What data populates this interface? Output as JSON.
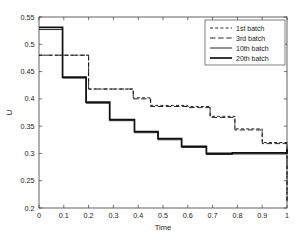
{
  "figure": {
    "background": "#ffffff",
    "axis_color": "#3b3b3b",
    "line_color": "#111111"
  },
  "axis": {
    "xlabel": "Time",
    "ylabel": "U",
    "x_ticks": [
      "0",
      "0.1",
      "0.2",
      "0.3",
      "0.4",
      "0.5",
      "0.6",
      "0.7",
      "0.8",
      "0.9",
      "1"
    ],
    "y_ticks": [
      "0.2",
      "0.25",
      "0.3",
      "0.35",
      "0.4",
      "0.45",
      "0.5",
      "0.55"
    ]
  },
  "legend": {
    "position": "top-right",
    "entries": [
      {
        "label": "1st batch",
        "style": "dashed-short",
        "width": 0.9
      },
      {
        "label": "3rd batch",
        "style": "dashed-long",
        "width": 0.9
      },
      {
        "label": "10th batch",
        "style": "solid",
        "width": 0.9
      },
      {
        "label": "20th batch",
        "style": "solid",
        "width": 1.7
      }
    ]
  },
  "chart_data": {
    "type": "line",
    "title": "",
    "xlabel": "Time",
    "ylabel": "U",
    "xlim": [
      0,
      1
    ],
    "ylim": [
      0.2,
      0.55
    ],
    "x_ticks": [
      0,
      0.1,
      0.2,
      0.3,
      0.4,
      0.5,
      0.6,
      0.7,
      0.8,
      0.9,
      1
    ],
    "y_ticks": [
      0.2,
      0.25,
      0.3,
      0.35,
      0.4,
      0.45,
      0.5,
      0.55
    ],
    "grid": false,
    "legend_position": "upper right",
    "step_style": "post",
    "series": [
      {
        "name": "1st batch",
        "style": "dashed-short",
        "linewidth": 0.9,
        "x": [
          0,
          0.1,
          0.2,
          0.29,
          0.38,
          0.45,
          0.5,
          0.6,
          0.69,
          0.79,
          0.9,
          1.0
        ],
        "values": [
          0.48,
          0.48,
          0.418,
          0.418,
          0.402,
          0.388,
          0.388,
          0.386,
          0.368,
          0.345,
          0.32,
          0.212
        ]
      },
      {
        "name": "3rd batch",
        "style": "dashed-long",
        "linewidth": 0.9,
        "x": [
          0,
          0.1,
          0.2,
          0.29,
          0.38,
          0.45,
          0.5,
          0.6,
          0.69,
          0.79,
          0.9,
          1.0
        ],
        "values": [
          0.48,
          0.48,
          0.418,
          0.418,
          0.4,
          0.386,
          0.386,
          0.384,
          0.366,
          0.343,
          0.318,
          0.212
        ]
      },
      {
        "name": "10th batch",
        "style": "solid",
        "linewidth": 0.9,
        "x": [
          0,
          0.095,
          0.19,
          0.285,
          0.385,
          0.48,
          0.575,
          0.675,
          0.78,
          0.89,
          1.0
        ],
        "values": [
          0.527,
          0.438,
          0.392,
          0.36,
          0.338,
          0.325,
          0.311,
          0.298,
          0.299,
          0.299,
          0.307
        ]
      },
      {
        "name": "20th batch",
        "style": "solid",
        "linewidth": 1.7,
        "x": [
          0,
          0.095,
          0.19,
          0.285,
          0.385,
          0.48,
          0.575,
          0.675,
          0.78,
          0.89,
          1.0
        ],
        "values": [
          0.531,
          0.44,
          0.394,
          0.362,
          0.34,
          0.327,
          0.313,
          0.3,
          0.301,
          0.301,
          0.308
        ]
      }
    ]
  }
}
